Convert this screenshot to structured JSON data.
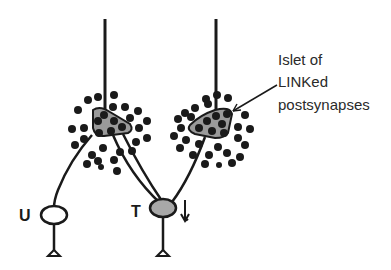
{
  "diagram": {
    "annotation": {
      "lines": [
        "Islet of",
        "LINKed",
        "postsynapses"
      ]
    },
    "neurons": {
      "untrained": {
        "label": "U"
      },
      "trained": {
        "label": "T",
        "marker": "↓"
      }
    },
    "colors": {
      "stroke": "#1a1a1a",
      "islet_fill": "#9a9a9a",
      "trained_fill": "#a8a8a8",
      "untrained_fill": "#ffffff",
      "dot": "#1a1a1a"
    }
  }
}
